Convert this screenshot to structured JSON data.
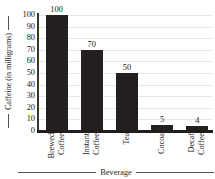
{
  "chart_data": {
    "type": "bar",
    "title": "",
    "xlabel": "Beverage",
    "ylabel": "Caffeine (in milligrams)",
    "categories": [
      "Brewed Coffee",
      "Instant Coffee",
      "Tea",
      "Cocoa",
      "Decaf Coffee"
    ],
    "category_lines": [
      [
        "Brewed",
        "Coffee"
      ],
      [
        "Instant",
        "Coffee"
      ],
      [
        "Tea"
      ],
      [
        "Cocoa"
      ],
      [
        "Decaf",
        "Coffee"
      ]
    ],
    "values": [
      100,
      70,
      50,
      5,
      4
    ],
    "value_labels": [
      "100",
      "70",
      "50",
      "5",
      "4"
    ],
    "ylim": [
      0,
      100
    ],
    "ytick_labels": [
      "100",
      "90",
      "80",
      "70",
      "60",
      "50",
      "40",
      "30",
      "20",
      "10",
      "0"
    ],
    "ytick_values": [
      100,
      90,
      80,
      70,
      60,
      50,
      40,
      30,
      20,
      10,
      0
    ],
    "grid": true,
    "legend": "none",
    "bar_color": "#231f1f",
    "grid_color": "#e9e7e6",
    "axis_color": "#201d1c",
    "text_color": "#1d1a19",
    "background_color": "#ffffff"
  }
}
